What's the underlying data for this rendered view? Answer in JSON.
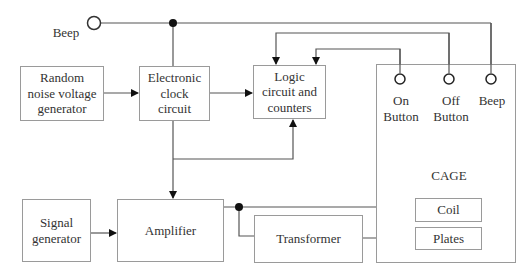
{
  "diagram": {
    "type": "block-diagram",
    "beep_input": {
      "label": "Beep"
    },
    "blocks": {
      "random_noise": {
        "label": "Random\nnoise voltage\ngenerator"
      },
      "clock": {
        "label": "Electronic\nclock\ncircuit"
      },
      "logic": {
        "label": "Logic\ncircuit and\ncounters"
      },
      "signal_generator": {
        "label": "Signal\ngenerator"
      },
      "amplifier": {
        "label": "Amplifier"
      },
      "transformer": {
        "label": "Transformer"
      },
      "cage": {
        "label": "CAGE",
        "terminals": [
          {
            "label": "On\nButton"
          },
          {
            "label": "Off\nButton"
          },
          {
            "label": "Beep"
          }
        ],
        "coil": {
          "label": "Coil"
        },
        "plates": {
          "label": "Plates"
        }
      }
    },
    "connections": [
      {
        "from": "Random noise voltage generator",
        "to": "Electronic clock circuit"
      },
      {
        "from": "Electronic clock circuit",
        "to": "Logic circuit and counters"
      },
      {
        "from": "Electronic clock circuit",
        "to": "Amplifier"
      },
      {
        "from": "Electronic clock circuit",
        "to": "Logic circuit and counters",
        "via": "bottom feedback"
      },
      {
        "from": "Beep input",
        "to": "Cage Beep terminal"
      },
      {
        "from": "Off Button",
        "to": "Logic circuit and counters"
      },
      {
        "from": "On Button",
        "to": "Logic circuit and counters"
      },
      {
        "from": "Signal generator",
        "to": "Amplifier"
      },
      {
        "from": "Amplifier",
        "to": "Coil"
      },
      {
        "from": "Amplifier",
        "to": "Transformer"
      },
      {
        "from": "Transformer",
        "to": "Plates"
      }
    ]
  }
}
